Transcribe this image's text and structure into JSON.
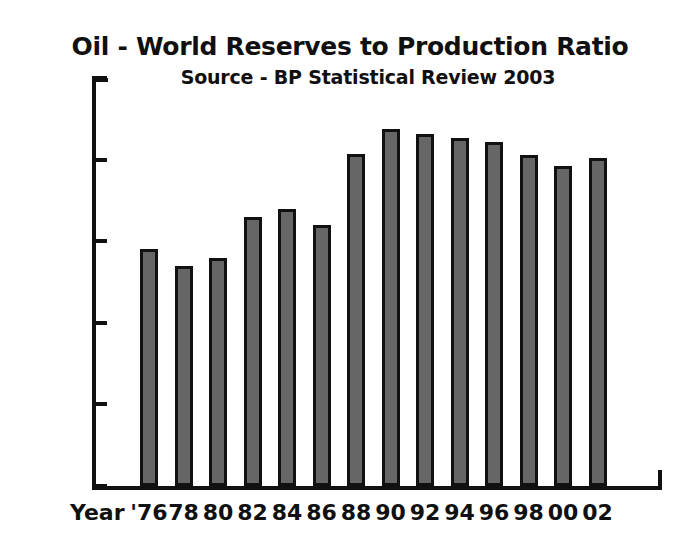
{
  "chart_data": {
    "type": "bar",
    "title": "Oil - World Reserves to Production Ratio",
    "subtitle": "Source - BP Statistical Review 2003",
    "xlabel": "Year",
    "ylabel": "",
    "categories": [
      "'76",
      "78",
      "80",
      "82",
      "84",
      "86",
      "88",
      "90",
      "92",
      "94",
      "96",
      "98",
      "00",
      "02"
    ],
    "values": [
      29,
      27,
      28,
      33,
      34,
      32,
      40.7,
      43.7,
      43.2,
      42.7,
      42.2,
      40.6,
      39.2,
      40.2
    ],
    "ylim": [
      0,
      50
    ],
    "yticks": [
      0,
      10,
      20,
      30,
      40,
      50
    ],
    "ytick_labels": [
      "0",
      "10",
      "20",
      "30",
      "40",
      "50"
    ],
    "grid": false,
    "legend": "none",
    "bar_fill_color": "#666666",
    "bar_edge_color": "#111111",
    "background_color": "#ffffff",
    "axis_color": "#111111"
  }
}
